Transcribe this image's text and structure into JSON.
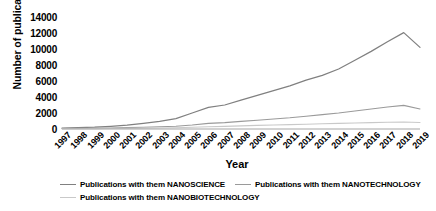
{
  "chart_data": {
    "type": "line",
    "title": "",
    "xlabel": "Year",
    "ylabel": "Number of publications",
    "x": [
      1997,
      1998,
      1999,
      2000,
      2001,
      2002,
      2003,
      2004,
      2005,
      2006,
      2007,
      2008,
      2009,
      2010,
      2011,
      2012,
      2013,
      2014,
      2015,
      2016,
      2017,
      2018,
      2019
    ],
    "xtick_labels": [
      "1997",
      "1998",
      "1999",
      "2000",
      "2001",
      "2002",
      "2003",
      "2004",
      "2005",
      "2006",
      "2007",
      "2008",
      "2009",
      "2010",
      "2011",
      "2012",
      "2013",
      "2014",
      "2015",
      "2016",
      "2017",
      "2018",
      "2019"
    ],
    "ytick_labels": [
      "14000",
      "12000",
      "10000",
      "8000",
      "6000",
      "4000",
      "2000",
      "0"
    ],
    "ytick_values": [
      14000,
      12000,
      10000,
      8000,
      6000,
      4000,
      2000,
      0
    ],
    "ylim": [
      0,
      14000
    ],
    "grid": false,
    "legend_position": "bottom",
    "series": [
      {
        "name": "Publications with them NANOSCIENCE",
        "color": "#808080",
        "values": [
          120,
          160,
          220,
          330,
          480,
          700,
          950,
          1300,
          2000,
          2700,
          3000,
          3600,
          4200,
          4800,
          5400,
          6100,
          6700,
          7500,
          8600,
          9700,
          10900,
          12050,
          10200
        ]
      },
      {
        "name": "Publications with them NANOTECHNOLOGY",
        "color": "#9a9a9a",
        "values": [
          60,
          80,
          100,
          130,
          170,
          220,
          280,
          350,
          500,
          700,
          800,
          950,
          1100,
          1250,
          1400,
          1600,
          1800,
          2000,
          2250,
          2500,
          2750,
          2950,
          2500
        ]
      },
      {
        "name": "Publications with them NANOBIOTECHNOLOGY",
        "color": "#c9c9c9",
        "values": [
          30,
          35,
          45,
          60,
          80,
          105,
          130,
          160,
          210,
          280,
          330,
          390,
          450,
          500,
          550,
          600,
          650,
          700,
          750,
          800,
          840,
          880,
          820
        ]
      }
    ]
  },
  "legend": {
    "rows": [
      [
        {
          "label": "Publications with them NANOSCIENCE",
          "color": "#808080"
        },
        {
          "label": "Publications with them NANOTECHNOLOGY",
          "color": "#9a9a9a"
        }
      ],
      [
        {
          "label": "Publications with them NANOBIOTECHNOLOGY",
          "color": "#c9c9c9"
        }
      ]
    ]
  },
  "axis": {
    "baseline_color": "#a6a6a6"
  }
}
